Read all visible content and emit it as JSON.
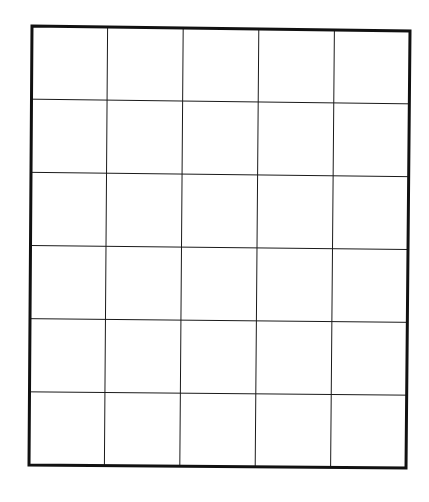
{
  "grid": {
    "columns": 5,
    "rows": 6,
    "cells": [
      [
        "",
        "",
        "",
        "",
        ""
      ],
      [
        "",
        "",
        "",
        "",
        ""
      ],
      [
        "",
        "",
        "",
        "",
        ""
      ],
      [
        "",
        "",
        "",
        "",
        ""
      ],
      [
        "",
        "",
        "",
        "",
        ""
      ],
      [
        "",
        "",
        "",
        "",
        ""
      ]
    ],
    "frame": {
      "top_left": [
        32,
        26
      ],
      "top_right": [
        410,
        31
      ],
      "bottom_right": [
        406,
        468
      ],
      "bottom_left": [
        29,
        465
      ]
    },
    "line_color": "#1a1a1a",
    "border_color": "#111111",
    "background_color": "#ffffff"
  }
}
